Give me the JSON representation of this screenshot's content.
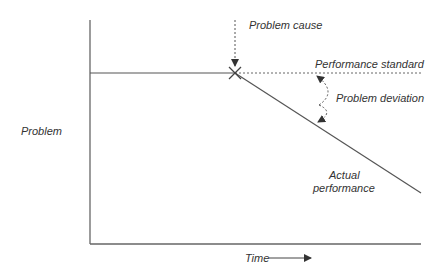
{
  "diagram": {
    "type": "problem-deviation-graph",
    "labels": {
      "y_axis": "Problem",
      "x_axis": "Time",
      "problem_cause": "Problem cause",
      "performance_standard": "Performance standard",
      "problem_deviation": "Problem deviation",
      "actual_performance_line1": "Actual",
      "actual_performance_line2": "performance"
    },
    "colors": {
      "line": "#555555",
      "text": "#333333"
    }
  }
}
